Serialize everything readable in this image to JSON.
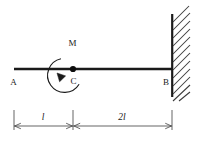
{
  "figure": {
    "type": "engineering-beam-diagram",
    "background_color": "#ffffff",
    "line_color": "#1a1a1a",
    "hatch_color": "#3a3a3a",
    "dimension_color": "#4a4a4a"
  },
  "beam": {
    "name": "beam",
    "left_label": "A",
    "right_label": "B",
    "left_x": 14,
    "right_x": 172,
    "y": 69,
    "thickness": 2.6
  },
  "supports": {
    "fixed_wall": {
      "label": "fixed-support-wall",
      "x": 172,
      "top": 14,
      "bottom": 97,
      "hatch_count": 11,
      "hatch_length": 17
    }
  },
  "loads": {
    "moment": {
      "label": "M",
      "point_label": "C",
      "center_x": 73,
      "center_y": 69,
      "radius": 17,
      "direction": "counterclockwise",
      "arrow_angle_deg": 205,
      "gap_start_deg": 70,
      "gap_end_deg": 110
    }
  },
  "points": [
    {
      "name": "point-A",
      "label": "A",
      "x": 14,
      "y": 69
    },
    {
      "name": "point-C",
      "label": "C",
      "x": 73,
      "y": 69
    },
    {
      "name": "point-B",
      "label": "B",
      "x": 172,
      "y": 69
    }
  ],
  "dimensions": {
    "baseline_y": 126,
    "tick_top": 110,
    "segments": [
      {
        "name": "dimension-A-to-C",
        "label": "l",
        "from_x": 14,
        "to_x": 73,
        "label_x": 43,
        "label_y": 119
      },
      {
        "name": "dimension-C-to-B",
        "label": "2l",
        "from_x": 73,
        "to_x": 172,
        "label_x": 122,
        "label_y": 119
      }
    ]
  },
  "labels": {
    "A": "A",
    "B": "B",
    "C": "C",
    "M": "M",
    "dim_left": "l",
    "dim_right": "2l"
  }
}
